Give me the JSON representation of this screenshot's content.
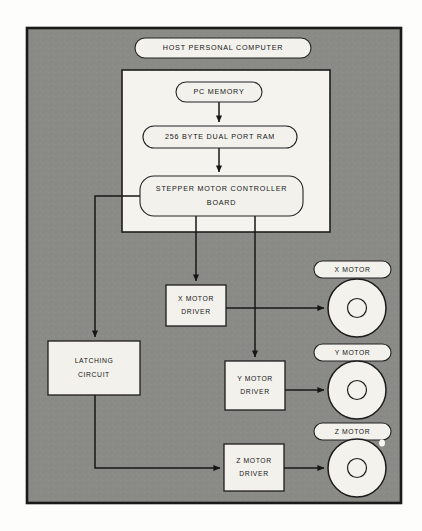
{
  "diagram": {
    "background_color": "#fdfdfb",
    "frame_fill": "#8a8a86",
    "node_fill": "#f2f1ec",
    "line_color": "#171717",
    "panel_fill": "#f4f3ee",
    "nodes": {
      "host_computer": {
        "label": "HOST PERSONAL COMPUTER",
        "shape": "pill",
        "x": 135,
        "y": 38,
        "width": 176,
        "height": 20
      },
      "pc_memory": {
        "label": "PC MEMORY",
        "shape": "pill",
        "x": 176,
        "y": 82,
        "width": 86,
        "height": 20
      },
      "dual_port_ram": {
        "label": "256 BYTE DUAL PORT RAM",
        "shape": "pill",
        "x": 143,
        "y": 126,
        "width": 154,
        "height": 22
      },
      "stepper_controller": {
        "label_line1": "STEPPER MOTOR CONTROLLER",
        "label_line2": "BOARD",
        "shape": "pill",
        "x": 140,
        "y": 176,
        "width": 163,
        "height": 40
      },
      "x_motor_driver": {
        "label_line1": "X MOTOR",
        "label_line2": "DRIVER",
        "shape": "rect",
        "x": 166,
        "y": 285,
        "width": 60,
        "height": 41
      },
      "latching_circuit": {
        "label_line1": "LATCHING",
        "label_line2": "CIRCUIT",
        "shape": "rect",
        "x": 48,
        "y": 341,
        "width": 92,
        "height": 54
      },
      "y_motor_driver": {
        "label_line1": "Y MOTOR",
        "label_line2": "DRIVER",
        "shape": "rect",
        "x": 225,
        "y": 361,
        "width": 60,
        "height": 49
      },
      "z_motor_driver": {
        "label_line1": "Z MOTOR",
        "label_line2": "DRIVER",
        "shape": "rect",
        "x": 224,
        "y": 444,
        "width": 60,
        "height": 47
      },
      "host_panel": {
        "shape": "rect",
        "x": 122,
        "y": 70,
        "width": 208,
        "height": 162
      },
      "outer_frame": {
        "shape": "rect",
        "x": 27,
        "y": 28,
        "width": 374,
        "height": 475
      }
    },
    "motors": [
      {
        "id": "x_motor",
        "label": "X MOTOR",
        "pill_x": 314,
        "pill_y": 261,
        "pill_width": 77,
        "pill_height": 17,
        "cx": 357,
        "cy": 308,
        "r_outer": 29,
        "r_inner": 9.5
      },
      {
        "id": "y_motor",
        "label": "Y MOTOR",
        "pill_x": 314,
        "pill_y": 344,
        "pill_width": 77,
        "pill_height": 17,
        "cx": 357,
        "cy": 390,
        "r_outer": 29,
        "r_inner": 9.5
      },
      {
        "id": "z_motor",
        "label": "Z MOTOR",
        "pill_x": 314,
        "pill_y": 423,
        "pill_width": 77,
        "pill_height": 17,
        "cx": 357,
        "cy": 468,
        "r_outer": 29,
        "r_inner": 9.5
      }
    ],
    "connections": [
      {
        "id": "memory-to-ram",
        "from": "pc_memory",
        "to": "dual_port_ram",
        "path": "M 219 102 L 219 122",
        "arrow": true
      },
      {
        "id": "ram-to-controller",
        "from": "dual_port_ram",
        "to": "stepper_controller",
        "path": "M 219 148 L 219 172",
        "arrow": true
      },
      {
        "id": "controller-to-xdriver",
        "from": "stepper_controller",
        "to": "x_motor_driver",
        "path": "M 196 216 L 196 281",
        "arrow": true
      },
      {
        "id": "controller-to-ydriver",
        "from": "stepper_controller",
        "to": "y_motor_driver",
        "path": "M 255 216 L 255 357",
        "arrow": true
      },
      {
        "id": "controller-to-latching",
        "from": "stepper_controller",
        "to": "latching_circuit",
        "path": "M 140 196 L 95 196 L 95 337",
        "arrow": true
      },
      {
        "id": "latching-to-zdriver",
        "from": "latching_circuit",
        "to": "z_motor_driver",
        "path": "M 95 395 L 95 468 L 220 468",
        "arrow": true
      },
      {
        "id": "xdriver-to-xmotor",
        "from": "x_motor_driver",
        "to": "x_motor",
        "path": "M 226 308 L 324 308",
        "arrow": true
      },
      {
        "id": "ydriver-to-ymotor",
        "from": "y_motor_driver",
        "to": "y_motor",
        "path": "M 285 390 L 324 390",
        "arrow": true
      },
      {
        "id": "zdriver-to-zmotor",
        "from": "z_motor_driver",
        "to": "z_motor",
        "path": "M 284 468 L 324 468",
        "arrow": true
      }
    ]
  }
}
